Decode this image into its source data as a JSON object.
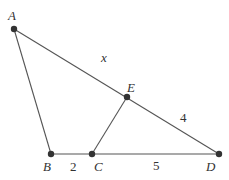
{
  "diagram": {
    "type": "geometry-triangle",
    "points": [
      {
        "id": "A",
        "label": "A",
        "x": 14,
        "y": 29,
        "lx": 8,
        "ly": 20
      },
      {
        "id": "B",
        "label": "B",
        "x": 51,
        "y": 154,
        "lx": 43,
        "ly": 171
      },
      {
        "id": "C",
        "label": "C",
        "x": 92,
        "y": 154,
        "lx": 94,
        "ly": 171
      },
      {
        "id": "D",
        "label": "D",
        "x": 219,
        "y": 154,
        "lx": 206,
        "ly": 171
      },
      {
        "id": "E",
        "label": "E",
        "x": 127,
        "y": 97,
        "lx": 127,
        "ly": 92
      }
    ],
    "segments": [
      {
        "from": "A",
        "to": "B"
      },
      {
        "from": "A",
        "to": "D"
      },
      {
        "from": "B",
        "to": "D"
      },
      {
        "from": "C",
        "to": "E"
      }
    ],
    "segment_labels": [
      {
        "text": "x",
        "x": 101,
        "y": 62,
        "italic": true,
        "refers_to": "AE"
      },
      {
        "text": "4",
        "x": 180,
        "y": 122,
        "italic": false,
        "refers_to": "ED"
      },
      {
        "text": "2",
        "x": 70,
        "y": 171,
        "italic": false,
        "refers_to": "BC"
      },
      {
        "text": "5",
        "x": 153,
        "y": 170,
        "italic": false,
        "refers_to": "CD"
      }
    ],
    "colors": {
      "line": "#555555",
      "point": "#333333",
      "text": "#333333"
    }
  }
}
